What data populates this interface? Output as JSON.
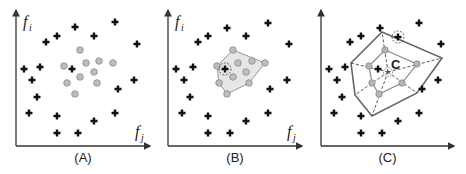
{
  "figure": {
    "panels": [
      {
        "id": "A",
        "caption": "(A)",
        "y_axis_label": "f",
        "y_axis_sub": "i",
        "x_axis_label": "f",
        "x_axis_sub": "j",
        "origin": [
          16,
          146
        ],
        "x_end": 150,
        "y_end": 10,
        "crosses": [
          [
            75,
            27
          ],
          [
            115,
            22
          ],
          [
            57,
            36
          ],
          [
            94,
            36
          ],
          [
            46,
            42
          ],
          [
            137,
            44
          ],
          [
            24,
            69
          ],
          [
            40,
            67
          ],
          [
            72,
            69
          ],
          [
            32,
            80
          ],
          [
            134,
            80
          ],
          [
            118,
            89
          ],
          [
            37,
            97
          ],
          [
            29,
            113
          ],
          [
            57,
            116
          ],
          [
            115,
            113
          ],
          [
            94,
            121
          ],
          [
            57,
            133
          ],
          [
            78,
            133
          ]
        ],
        "circles": [
          [
            80,
            50
          ],
          [
            86,
            63
          ],
          [
            99,
            61
          ],
          [
            113,
            63
          ],
          [
            64,
            66
          ],
          [
            94,
            72
          ],
          [
            80,
            77
          ],
          [
            67,
            83
          ],
          [
            97,
            83
          ],
          [
            75,
            94
          ]
        ]
      },
      {
        "id": "B",
        "caption": "(B)",
        "y_axis_label": "f",
        "y_axis_sub": "i",
        "x_axis_label": "f",
        "x_axis_sub": "j",
        "origin": [
          168,
          146
        ],
        "x_end": 302,
        "y_end": 10,
        "crosses": [
          [
            227,
            28
          ],
          [
            268,
            23
          ],
          [
            208,
            36
          ],
          [
            246,
            36
          ],
          [
            198,
            42
          ],
          [
            289,
            44
          ],
          [
            176,
            69
          ],
          [
            193,
            67
          ],
          [
            184,
            80
          ],
          [
            287,
            80
          ],
          [
            270,
            89
          ],
          [
            190,
            97
          ],
          [
            182,
            113
          ],
          [
            208,
            116
          ],
          [
            268,
            113
          ],
          [
            246,
            121
          ],
          [
            208,
            133
          ],
          [
            230,
            133
          ]
        ],
        "highlighted_cross": [
          225,
          69
        ],
        "hull": [
          [
            233,
            50
          ],
          [
            265,
            63
          ],
          [
            249,
            83
          ],
          [
            227,
            94
          ],
          [
            219,
            83
          ],
          [
            217,
            66
          ]
        ],
        "circles": [
          [
            238,
            63
          ],
          [
            252,
            61
          ],
          [
            246,
            72
          ],
          [
            233,
            77
          ]
        ]
      },
      {
        "id": "C",
        "caption": "(C)",
        "center_label": "C",
        "origin": [
          321,
          146
        ],
        "x_end": 454,
        "y_end": 10,
        "crosses": [
          [
            380,
            28
          ],
          [
            419,
            23
          ],
          [
            361,
            36
          ],
          [
            350,
            42
          ],
          [
            441,
            44
          ],
          [
            329,
            69
          ],
          [
            345,
            67
          ],
          [
            337,
            80
          ],
          [
            438,
            80
          ],
          [
            422,
            89
          ],
          [
            342,
            97
          ],
          [
            334,
            113
          ],
          [
            361,
            116
          ],
          [
            419,
            113
          ],
          [
            398,
            121
          ],
          [
            361,
            133
          ],
          [
            382,
            133
          ],
          [
            378,
            69
          ]
        ],
        "highlighted_cross": [
          398,
          37
        ],
        "outer_polygon": [
          [
            382,
            32
          ],
          [
            442,
            58
          ],
          [
            417,
            93
          ],
          [
            372,
            116
          ],
          [
            355,
            95
          ],
          [
            351,
            63
          ]
        ],
        "inner_polygon": [
          [
            385,
            50
          ],
          [
            417,
            64
          ],
          [
            402,
            83
          ],
          [
            379,
            94
          ],
          [
            372,
            83
          ],
          [
            369,
            66
          ]
        ],
        "center": [
          388,
          72
        ]
      }
    ]
  }
}
